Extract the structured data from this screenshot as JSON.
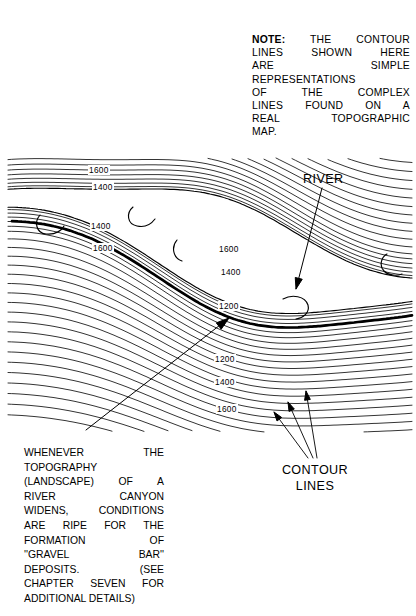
{
  "figure": {
    "kind": "topographic-contour-map-illustration",
    "background_color": "#ffffff",
    "ink_color": "#000000"
  },
  "note": {
    "lead": "NOTE:",
    "lines": [
      "THE CONTOUR",
      "LINES SHOWN HERE",
      "ARE SIMPLE",
      "REPRESENTATIONS",
      "OF THE COMPLEX",
      "LINES FOUND ON A",
      "REAL TOPOGRAPHIC",
      "MAP."
    ],
    "full_text": "NOTE: THE CONTOUR LINES SHOWN HERE ARE SIMPLE REPRESENTATIONS OF THE COMPLEX LINES FOUND ON A REAL TOPOGRAPHIC MAP."
  },
  "caption": {
    "lines": [
      "WHENEVER THE",
      "TOPOGRAPHY",
      "(LANDSCAPE) OF A",
      "RIVER CANYON",
      "WIDENS, CONDITIONS",
      "ARE RIPE FOR THE",
      "FORMATION OF",
      "''GRAVEL BAR''",
      "DEPOSITS. (SEE",
      "CHAPTER SEVEN FOR",
      "ADDITIONAL DETAILS)"
    ],
    "full_text": "WHENEVER THE TOPOGRAPHY (LANDSCAPE) OF A RIVER CANYON WIDENS, CONDITIONS ARE RIPE FOR THE FORMATION OF ''GRAVEL BAR'' DEPOSITS. (SEE CHAPTER SEVEN FOR ADDITIONAL DETAILS)"
  },
  "labels": {
    "river": "RIVER",
    "contour_line1": "CONTOUR",
    "contour_line2": "LINES"
  },
  "elevations": [
    {
      "value": "1600",
      "x": 88,
      "y": 165
    },
    {
      "value": "1400",
      "x": 92,
      "y": 182
    },
    {
      "value": "1400",
      "x": 90,
      "y": 221
    },
    {
      "value": "1600",
      "x": 92,
      "y": 243
    },
    {
      "value": "1600",
      "x": 218,
      "y": 244
    },
    {
      "value": "1400",
      "x": 220,
      "y": 267
    },
    {
      "value": "1200",
      "x": 218,
      "y": 301
    },
    {
      "value": "1200",
      "x": 214,
      "y": 354
    },
    {
      "value": "1400",
      "x": 214,
      "y": 377
    },
    {
      "value": "1600",
      "x": 216,
      "y": 404
    }
  ],
  "chart_data": {
    "type": "line",
    "contour_interval": 200,
    "units": "feet",
    "labeled_contours": [
      1200,
      1400,
      1600
    ],
    "annotations": [
      "RIVER",
      "CONTOUR LINES"
    ]
  }
}
